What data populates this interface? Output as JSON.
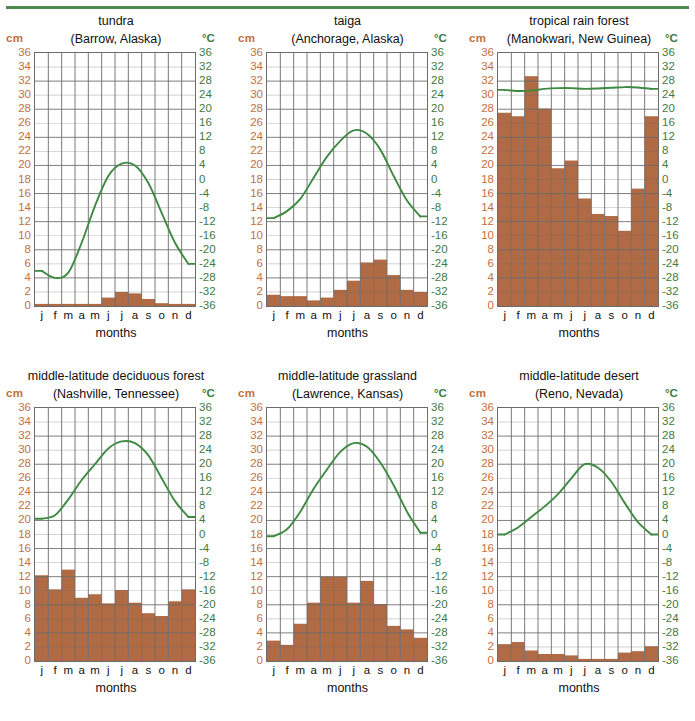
{
  "page": {
    "axis_left_unit": "cm",
    "axis_right_unit": "°C",
    "xlabel": "months",
    "month_labels": [
      "j",
      "f",
      "m",
      "a",
      "m",
      "j",
      "j",
      "a",
      "s",
      "o",
      "n",
      "d"
    ],
    "precip_ticks": [
      36,
      34,
      32,
      30,
      28,
      26,
      24,
      22,
      20,
      18,
      16,
      14,
      12,
      10,
      8,
      6,
      4,
      2,
      0
    ],
    "temp_ticks": [
      36,
      32,
      28,
      24,
      20,
      16,
      12,
      8,
      4,
      0,
      -4,
      -8,
      -12,
      -16,
      -20,
      -24,
      -28,
      -32,
      -36
    ],
    "colors": {
      "bar": "#b06b45",
      "line": "#3f8a43",
      "precip_axis_text": "#c2703f",
      "temp_axis_text": "#3f7a41",
      "grid": "#6b6b6b",
      "rule": "#4e8a4e"
    }
  },
  "chart_data": [
    {
      "type": "bar",
      "id": "tundra",
      "title": "tundra",
      "subtitle": "(Barrow, Alaska)",
      "xlabel": "months",
      "ylabel": "cm",
      "y2label": "°C",
      "categories": [
        "j",
        "f",
        "m",
        "a",
        "m",
        "j",
        "j",
        "a",
        "s",
        "o",
        "n",
        "d"
      ],
      "ylim": [
        0,
        36
      ],
      "y2lim": [
        -36,
        36
      ],
      "grid": true,
      "series": [
        {
          "name": "precipitation",
          "unit": "cm",
          "type": "bar",
          "values": [
            0.3,
            0.3,
            0.3,
            0.3,
            0.3,
            1.2,
            2.0,
            1.8,
            1.0,
            0.4,
            0.3,
            0.3
          ]
        },
        {
          "name": "temperature",
          "unit": "°C",
          "type": "line",
          "values": [
            -26.0,
            -28.0,
            -26.5,
            -18.0,
            -7.5,
            1.0,
            4.5,
            4.0,
            -1.0,
            -9.5,
            -18.0,
            -24.0
          ]
        }
      ]
    },
    {
      "type": "bar",
      "id": "taiga",
      "title": "taiga",
      "subtitle": "(Anchorage, Alaska)",
      "xlabel": "months",
      "ylabel": "cm",
      "y2label": "°C",
      "categories": [
        "j",
        "f",
        "m",
        "a",
        "m",
        "j",
        "j",
        "a",
        "s",
        "o",
        "n",
        "d"
      ],
      "ylim": [
        0,
        36
      ],
      "y2lim": [
        -36,
        36
      ],
      "grid": true,
      "series": [
        {
          "name": "precipitation",
          "unit": "cm",
          "type": "bar",
          "values": [
            1.6,
            1.4,
            1.4,
            0.8,
            1.2,
            2.3,
            3.6,
            6.2,
            6.6,
            4.4,
            2.3,
            2.0
          ]
        },
        {
          "name": "temperature",
          "unit": "°C",
          "type": "line",
          "values": [
            -11.0,
            -9.0,
            -5.5,
            0.5,
            6.5,
            11.0,
            14.0,
            13.0,
            8.5,
            1.0,
            -6.0,
            -10.5
          ]
        }
      ]
    },
    {
      "type": "bar",
      "id": "tropical-rain-forest",
      "title": "tropical rain forest",
      "subtitle": "(Manokwari, New Guinea)",
      "xlabel": "months",
      "ylabel": "cm",
      "y2label": "°C",
      "categories": [
        "j",
        "f",
        "m",
        "a",
        "m",
        "j",
        "j",
        "a",
        "s",
        "o",
        "n",
        "d"
      ],
      "ylim": [
        0,
        36
      ],
      "y2lim": [
        -36,
        36
      ],
      "grid": true,
      "series": [
        {
          "name": "precipitation",
          "unit": "cm",
          "type": "bar",
          "values": [
            27.5,
            27.0,
            32.7,
            28.1,
            19.6,
            20.7,
            15.3,
            13.1,
            12.8,
            10.7,
            16.7,
            27.0
          ]
        },
        {
          "name": "temperature",
          "unit": "°C",
          "type": "line",
          "values": [
            25.5,
            25.2,
            25.3,
            25.8,
            26.0,
            26.0,
            25.8,
            25.9,
            26.1,
            26.3,
            26.2,
            25.8
          ]
        }
      ]
    },
    {
      "type": "bar",
      "id": "middle-latitude-deciduous-forest",
      "title": "middle-latitude deciduous forest",
      "subtitle": "(Nashville, Tennessee)",
      "xlabel": "months",
      "ylabel": "cm",
      "y2label": "°C",
      "categories": [
        "j",
        "f",
        "m",
        "a",
        "m",
        "j",
        "j",
        "a",
        "s",
        "o",
        "n",
        "d"
      ],
      "ylim": [
        0,
        36
      ],
      "y2lim": [
        -36,
        36
      ],
      "grid": true,
      "series": [
        {
          "name": "precipitation",
          "unit": "cm",
          "type": "bar",
          "values": [
            12.2,
            10.2,
            13.0,
            9.0,
            9.5,
            8.2,
            10.1,
            8.3,
            6.8,
            6.4,
            8.5,
            10.2
          ]
        },
        {
          "name": "temperature",
          "unit": "°C",
          "type": "line",
          "values": [
            4.5,
            5.5,
            10.0,
            15.5,
            20.0,
            24.5,
            26.5,
            26.0,
            22.5,
            16.0,
            9.5,
            5.0
          ]
        }
      ]
    },
    {
      "type": "bar",
      "id": "middle-latitude-grassland",
      "title": "middle-latitude grassland",
      "subtitle": "(Lawrence, Kansas)",
      "xlabel": "months",
      "ylabel": "cm",
      "y2label": "°C",
      "categories": [
        "j",
        "f",
        "m",
        "a",
        "m",
        "j",
        "j",
        "a",
        "s",
        "o",
        "n",
        "d"
      ],
      "ylim": [
        0,
        36
      ],
      "y2lim": [
        -36,
        36
      ],
      "grid": true,
      "series": [
        {
          "name": "precipitation",
          "unit": "cm",
          "type": "bar",
          "values": [
            2.9,
            2.3,
            5.3,
            8.3,
            12.0,
            12.0,
            8.3,
            11.4,
            8.1,
            5.0,
            4.5,
            3.3
          ]
        },
        {
          "name": "temperature",
          "unit": "°C",
          "type": "line",
          "values": [
            -0.5,
            1.5,
            6.5,
            13.0,
            18.5,
            23.5,
            26.0,
            25.0,
            20.5,
            14.0,
            6.5,
            0.5
          ]
        }
      ]
    },
    {
      "type": "bar",
      "id": "middle-latitude-desert",
      "title": "middle-latitude desert",
      "subtitle": "(Reno, Nevada)",
      "xlabel": "months",
      "ylabel": "cm",
      "y2label": "°C",
      "categories": [
        "j",
        "f",
        "m",
        "a",
        "m",
        "j",
        "j",
        "a",
        "s",
        "o",
        "n",
        "d"
      ],
      "ylim": [
        0,
        36
      ],
      "y2lim": [
        -36,
        36
      ],
      "grid": true,
      "series": [
        {
          "name": "precipitation",
          "unit": "cm",
          "type": "bar",
          "values": [
            2.4,
            2.7,
            1.5,
            1.0,
            1.0,
            0.8,
            0.3,
            0.3,
            0.3,
            1.2,
            1.4,
            2.1
          ]
        },
        {
          "name": "temperature",
          "unit": "°C",
          "type": "line",
          "values": [
            0.0,
            2.0,
            5.0,
            8.0,
            11.5,
            16.0,
            20.0,
            19.0,
            15.0,
            9.0,
            3.5,
            0.0
          ]
        }
      ]
    }
  ]
}
